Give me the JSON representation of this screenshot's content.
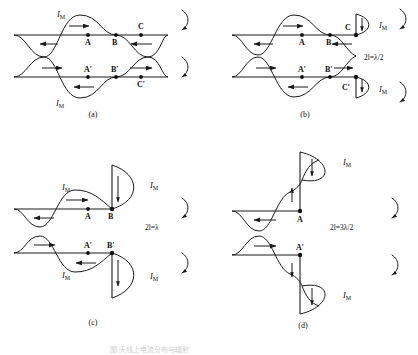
{
  "figure": {
    "panels": [
      {
        "id": "a",
        "caption": "(a)",
        "condition": "",
        "current_label": "I_M",
        "current_symbol": "I",
        "current_subscript": "M",
        "points_top": [
          "A",
          "B",
          "C"
        ],
        "points_bottom": [
          "A'",
          "B'",
          "C'"
        ],
        "rotation_arrows": 2,
        "arrow_directions_top": [
          "left",
          "right",
          "left"
        ],
        "arrow_directions_bottom": [
          "right",
          "left",
          "right"
        ]
      },
      {
        "id": "b",
        "caption": "(b)",
        "condition": "2l=λ/2",
        "current_label": "I_M",
        "current_symbol": "I",
        "current_subscript": "M",
        "points_top": [
          "A",
          "B",
          "C"
        ],
        "points_bottom": [
          "A'",
          "B'",
          "C'"
        ],
        "rotation_arrows": 2,
        "arrow_directions_top": [
          "left",
          "right",
          "left"
        ],
        "arrow_directions_bottom": [
          "right",
          "left",
          "right"
        ]
      },
      {
        "id": "c",
        "caption": "(c)",
        "condition": "2l=λ",
        "current_label": "I_M",
        "current_symbol": "I",
        "current_subscript": "M",
        "points_top": [
          "A",
          "B"
        ],
        "points_bottom": [
          "A'",
          "B'"
        ],
        "rotation_arrows": 2,
        "arrow_directions_top": [
          "left",
          "right"
        ],
        "arrow_directions_bottom": [
          "right",
          "left"
        ]
      },
      {
        "id": "d",
        "caption": "(d)",
        "condition": "2l=3λ/2",
        "current_label": "I_M",
        "current_symbol": "I",
        "current_subscript": "M",
        "points_top": [
          "A"
        ],
        "points_bottom": [
          "A'"
        ],
        "rotation_arrows": 2,
        "arrow_directions_top": [
          "left"
        ],
        "arrow_directions_bottom": [
          "right"
        ]
      }
    ],
    "labels": {
      "current_symbol": "I",
      "current_subscript": "M",
      "lambda": "λ",
      "point_a": "A",
      "point_b": "B",
      "point_c": "C",
      "point_a_prime": "A′",
      "point_b_prime": "B′",
      "point_c_prime": "C′",
      "eq_b": "2l=λ/2",
      "eq_c": "2l=λ",
      "eq_d": "2l=3λ/2",
      "cap_a": "(a)",
      "cap_b": "(b)",
      "cap_c": "(c)",
      "cap_d": "(d)"
    },
    "colors": {
      "stroke": "#1b1b1b",
      "background": "#ffffff",
      "text": "#111111",
      "footnote": "#cfcfcf"
    },
    "footnote": "图  天线上电流分布与辐射"
  }
}
